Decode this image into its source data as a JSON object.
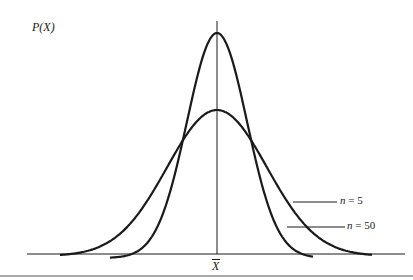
{
  "chart_data": {
    "type": "line",
    "title": "",
    "xlabel": "X̄",
    "ylabel": "P(X)",
    "grid": false,
    "series": [
      {
        "name": "n = 5",
        "shape": "normal",
        "relative_peak_height": 0.65,
        "relative_spread": 1.0
      },
      {
        "name": "n = 50",
        "shape": "normal",
        "relative_peak_height": 1.0,
        "relative_spread": 0.55
      }
    ],
    "annotations": [
      "n = 5",
      "n = 50"
    ],
    "center_label": "X̄"
  },
  "axes": {
    "y_label": "P(X)",
    "x_center_label": "X"
  },
  "legend": {
    "n5_prefix": "n",
    "n5_suffix": " = 5",
    "n50_prefix": "n",
    "n50_suffix": " = 50"
  },
  "colors": {
    "ink": "#1a1a1a",
    "background": "#ffffff"
  }
}
